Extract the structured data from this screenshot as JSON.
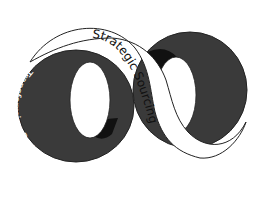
{
  "diagram": {
    "type": "infinity-loop",
    "labels": {
      "center_band": "Strategic Sourcing",
      "left_ring": "Transforming Partnerships",
      "right_ring": "Expanding Capability"
    },
    "colors": {
      "ring_fill": "#3a3a3a",
      "inner_shadow": "#111111",
      "band_fill": "#ffffff",
      "outline": "#222222",
      "background": "#ffffff"
    }
  }
}
